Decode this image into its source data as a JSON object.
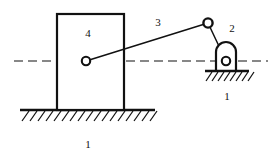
{
  "figure": {
    "type": "kinematic-mechanism-diagram",
    "width": 275,
    "height": 160,
    "background_color": "#ffffff",
    "line_color": "#111111"
  },
  "labels": {
    "slider_block": "4",
    "connecting_rod": "3",
    "rocker": "2",
    "ground_left": "1",
    "ground_right": "1"
  },
  "label_positions": {
    "slider_block": {
      "x": 88,
      "y": 34
    },
    "connecting_rod": {
      "x": 158,
      "y": 23
    },
    "rocker": {
      "x": 232,
      "y": 29
    },
    "ground_left": {
      "x": 88,
      "y": 145
    },
    "ground_right": {
      "x": 227,
      "y": 97
    }
  },
  "geometry": {
    "slider_block": {
      "x": 57,
      "y": 14,
      "width": 67,
      "height": 96
    },
    "slider_pivot": {
      "cx": 86,
      "cy": 61,
      "r": 4.2
    },
    "top_joint": {
      "cx": 208,
      "cy": 23,
      "r": 4.6
    },
    "rocker_pivot": {
      "cx": 226,
      "cy": 61,
      "r": 4.2
    },
    "connecting_rod_line": {
      "x1": 86,
      "y1": 61,
      "x2": 208,
      "y2": 23
    },
    "rocker_link_line": {
      "x1": 208,
      "y1": 23,
      "x2": 226,
      "y2": 61
    },
    "rocker_arch": {
      "left": 216,
      "right": 236,
      "top": 42,
      "bottom": 71
    },
    "centerline": {
      "x1": 14,
      "y1": 61,
      "x2": 268,
      "y2": 61
    },
    "ground_left_line": {
      "x1": 20,
      "y1": 110,
      "x2": 155,
      "y2": 110
    },
    "ground_right_line": {
      "x1": 205,
      "y1": 71,
      "x2": 249,
      "y2": 71
    }
  },
  "hatching": {
    "angle_deg": 60,
    "left_count": 17,
    "right_count": 8,
    "length": 13
  }
}
